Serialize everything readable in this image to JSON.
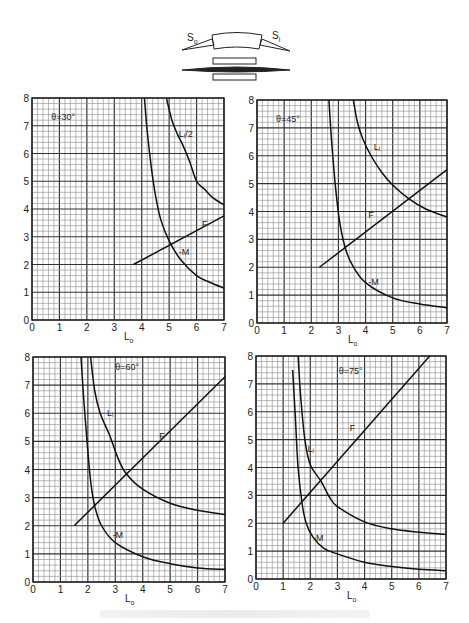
{
  "diagram": {
    "label_left": "S",
    "label_left_sub": "o",
    "label_right": "S",
    "label_right_sub": "i"
  },
  "chart_data": [
    {
      "type": "line",
      "title": "θ=30°",
      "xlabel": "L",
      "xlabel_sub": "o",
      "ylabel": "",
      "xlim": [
        0,
        7
      ],
      "ylim": [
        0,
        8
      ],
      "x_ticks": [
        0,
        1,
        2,
        3,
        4,
        5,
        6,
        7
      ],
      "y_ticks": [
        0,
        1,
        2,
        3,
        4,
        5,
        6,
        7,
        8
      ],
      "grid": {
        "major": 1,
        "minor": 0.2
      },
      "frame": {
        "x0": 32,
        "x1": 224,
        "y0": 320,
        "y1": 98
      },
      "title_pos": [
        0.7,
        7.2
      ],
      "series": [
        {
          "name": "L_i/2",
          "label": "Lᵢ/2",
          "label_pos": [
            5.35,
            6.6
          ],
          "points": [
            [
              4.9,
              8
            ],
            [
              5.1,
              7.2
            ],
            [
              5.3,
              6.7
            ],
            [
              5.5,
              6.3
            ],
            [
              5.75,
              5.7
            ],
            [
              6.0,
              5.0
            ],
            [
              6.3,
              4.7
            ],
            [
              6.6,
              4.4
            ],
            [
              7.0,
              4.15
            ]
          ]
        },
        {
          "name": "F",
          "label": "F",
          "label_pos": [
            6.2,
            3.35
          ],
          "points": [
            [
              3.7,
              2.0
            ],
            [
              7.0,
              3.75
            ]
          ]
        },
        {
          "name": "-M",
          "label": "-M",
          "label_pos": [
            5.35,
            2.35
          ],
          "points": [
            [
              4.1,
              8
            ],
            [
              4.2,
              6.8
            ],
            [
              4.35,
              5.5
            ],
            [
              4.5,
              4.5
            ],
            [
              4.7,
              3.6
            ],
            [
              5.0,
              2.85
            ],
            [
              5.4,
              2.2
            ],
            [
              6.0,
              1.6
            ],
            [
              6.5,
              1.35
            ],
            [
              7.0,
              1.15
            ]
          ]
        }
      ]
    },
    {
      "type": "line",
      "title": "θ=45°",
      "xlabel": "L",
      "xlabel_sub": "o",
      "ylabel": "",
      "xlim": [
        0,
        7
      ],
      "ylim": [
        0,
        8
      ],
      "x_ticks": [
        0,
        1,
        2,
        3,
        4,
        5,
        6,
        7
      ],
      "y_ticks": [
        0,
        1,
        2,
        3,
        4,
        5,
        6,
        7,
        8
      ],
      "grid": {
        "major": 1,
        "minor": 0.2
      },
      "frame": {
        "x0": 257,
        "x1": 447,
        "y0": 323,
        "y1": 100
      },
      "title_pos": [
        0.7,
        7.2
      ],
      "series": [
        {
          "name": "L_i",
          "label": "Lᵢ",
          "label_pos": [
            4.3,
            6.2
          ],
          "points": [
            [
              3.55,
              8
            ],
            [
              3.7,
              7.2
            ],
            [
              3.9,
              6.6
            ],
            [
              4.2,
              6.0
            ],
            [
              4.6,
              5.4
            ],
            [
              5.0,
              4.95
            ],
            [
              5.6,
              4.45
            ],
            [
              6.2,
              4.1
            ],
            [
              7.0,
              3.8
            ]
          ]
        },
        {
          "name": "F",
          "label": "F",
          "label_pos": [
            4.1,
            3.75
          ],
          "points": [
            [
              2.3,
              2.0
            ],
            [
              7.0,
              5.5
            ]
          ]
        },
        {
          "name": "-M",
          "label": "-M",
          "label_pos": [
            4.1,
            1.35
          ],
          "points": [
            [
              2.65,
              8
            ],
            [
              2.75,
              6.5
            ],
            [
              2.9,
              4.8
            ],
            [
              3.05,
              3.6
            ],
            [
              3.25,
              2.7
            ],
            [
              3.5,
              2.1
            ],
            [
              4.0,
              1.45
            ],
            [
              5.0,
              0.9
            ],
            [
              6.0,
              0.68
            ],
            [
              7.0,
              0.55
            ]
          ]
        }
      ]
    },
    {
      "type": "line",
      "title": "θ=60°",
      "xlabel": "L",
      "xlabel_sub": "o",
      "ylabel": "",
      "xlim": [
        0,
        7
      ],
      "ylim": [
        0,
        8
      ],
      "x_ticks": [
        0,
        1,
        2,
        3,
        4,
        5,
        6,
        7
      ],
      "y_ticks": [
        0,
        1,
        2,
        3,
        4,
        5,
        6,
        7,
        8
      ],
      "grid": {
        "major": 1,
        "minor": 0.2
      },
      "frame": {
        "x0": 33,
        "x1": 225,
        "y0": 582,
        "y1": 357
      },
      "title_pos": [
        3.0,
        7.55
      ],
      "series": [
        {
          "name": "L_i",
          "label": "Lᵢ",
          "label_pos": [
            2.7,
            5.9
          ],
          "points": [
            [
              2.1,
              8
            ],
            [
              2.25,
              6.8
            ],
            [
              2.45,
              6.0
            ],
            [
              2.8,
              5.2
            ],
            [
              3.1,
              4.4
            ],
            [
              3.4,
              3.85
            ],
            [
              4.0,
              3.3
            ],
            [
              5.0,
              2.8
            ],
            [
              6.0,
              2.55
            ],
            [
              7.0,
              2.4
            ]
          ]
        },
        {
          "name": "F",
          "label": "F",
          "label_pos": [
            4.6,
            5.1
          ],
          "points": [
            [
              1.5,
              2.0
            ],
            [
              7.0,
              7.3
            ]
          ]
        },
        {
          "name": "-M",
          "label": "-M",
          "label_pos": [
            2.9,
            1.55
          ],
          "points": [
            [
              1.75,
              8
            ],
            [
              1.85,
              6.5
            ],
            [
              1.97,
              5.0
            ],
            [
              2.1,
              3.6
            ],
            [
              2.25,
              2.7
            ],
            [
              2.5,
              2.0
            ],
            [
              3.0,
              1.4
            ],
            [
              4.0,
              0.9
            ],
            [
              5.0,
              0.65
            ],
            [
              6.0,
              0.5
            ],
            [
              7.0,
              0.45
            ]
          ]
        }
      ]
    },
    {
      "type": "line",
      "title": "θ=75°",
      "xlabel": "L",
      "xlabel_sub": "o",
      "ylabel": "",
      "xlim": [
        0,
        7
      ],
      "ylim": [
        0,
        8
      ],
      "x_ticks": [
        0,
        1,
        2,
        3,
        4,
        5,
        6,
        7
      ],
      "y_ticks": [
        0,
        1,
        2,
        3,
        4,
        5,
        6,
        7,
        8
      ],
      "grid": {
        "major": 1,
        "minor": 0.2
      },
      "frame": {
        "x0": 256,
        "x1": 446,
        "y0": 579,
        "y1": 356
      },
      "title_pos": [
        3.05,
        7.35
      ],
      "series": [
        {
          "name": "L_i",
          "label": "Lᵢ",
          "label_pos": [
            1.9,
            4.55
          ],
          "points": [
            [
              1.55,
              8
            ],
            [
              1.65,
              6.5
            ],
            [
              1.8,
              5.0
            ],
            [
              2.0,
              4.1
            ],
            [
              2.4,
              3.5
            ],
            [
              2.7,
              2.95
            ],
            [
              3.0,
              2.6
            ],
            [
              4.0,
              2.05
            ],
            [
              5.0,
              1.8
            ],
            [
              6.0,
              1.68
            ],
            [
              7.0,
              1.6
            ]
          ]
        },
        {
          "name": "F",
          "label": "F",
          "label_pos": [
            3.45,
            5.3
          ],
          "points": [
            [
              1.0,
              2.0
            ],
            [
              6.4,
              8.0
            ]
          ]
        },
        {
          "name": "-M",
          "label": "-M",
          "label_pos": [
            2.1,
            1.35
          ],
          "points": [
            [
              1.35,
              7.5
            ],
            [
              1.45,
              5.8
            ],
            [
              1.55,
              4.0
            ],
            [
              1.7,
              2.7
            ],
            [
              1.85,
              2.0
            ],
            [
              2.1,
              1.5
            ],
            [
              2.5,
              1.1
            ],
            [
              3.0,
              0.9
            ],
            [
              4.0,
              0.6
            ],
            [
              5.0,
              0.45
            ],
            [
              6.0,
              0.35
            ],
            [
              7.0,
              0.3
            ]
          ]
        }
      ]
    }
  ]
}
